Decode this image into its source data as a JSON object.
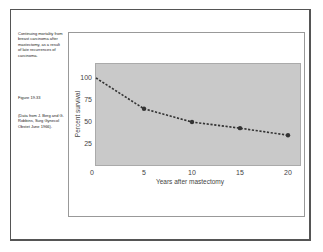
{
  "figure": {
    "caption": "Continuing mortality from breast carcinoma after mastectomy, as a result of late recurrences of carcinoma.",
    "label": "Figure 19.33",
    "source": "(Data from J. Berg and G. Robbins, Surg Gynecol Obstet June 1966)."
  },
  "colors": {
    "plot_background": "#c9c9c9",
    "line": "#333333",
    "frame": "#555555"
  },
  "chart_data": {
    "type": "line",
    "title": "",
    "xlabel": "Years after mastectomy",
    "ylabel": "Percent survival",
    "x": [
      0,
      5,
      10,
      15,
      20
    ],
    "series": [
      {
        "name": "Survival",
        "values": [
          100,
          65,
          50,
          43,
          35
        ],
        "markers": [
          false,
          true,
          true,
          true,
          true
        ],
        "style": "dashed"
      }
    ],
    "xticks": [
      "0",
      "5",
      "10",
      "15",
      "20"
    ],
    "yticks": [
      "100",
      "75",
      "50",
      "25"
    ],
    "xlim": [
      0,
      20
    ],
    "ylim": [
      0,
      117
    ],
    "grid": false,
    "legend": null
  }
}
